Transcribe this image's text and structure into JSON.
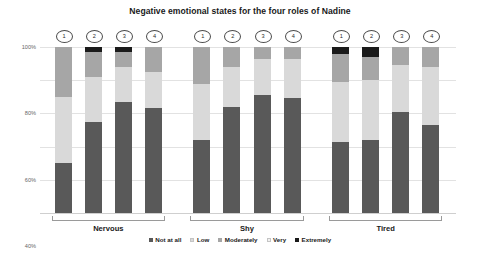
{
  "chart_data": {
    "type": "bar",
    "subtype": "stacked-100-percent",
    "title": "Negative emotional states for the four roles of Nadine",
    "xlabel": "",
    "ylabel": "",
    "ylim": [
      0,
      100
    ],
    "ytick_labels": [
      "0%",
      "20%",
      "40%",
      "60%",
      "80%",
      "100%"
    ],
    "ytick_values": [
      0,
      20,
      40,
      60,
      80,
      100
    ],
    "grid": true,
    "legend_position": "bottom",
    "groups": [
      "Nervous",
      "Shy",
      "Tired"
    ],
    "role_labels": [
      "1",
      "2",
      "3",
      "4"
    ],
    "categories": [
      "Nervous 1",
      "Nervous 2",
      "Nervous 3",
      "Nervous 4",
      "Shy 1",
      "Shy 2",
      "Shy 3",
      "Shy 4",
      "Tired 1",
      "Tired 2",
      "Tired 3",
      "Tired 4"
    ],
    "series": [
      {
        "name": "Not at all",
        "color": "#595959",
        "values": [
          30,
          55,
          67,
          63,
          44,
          64,
          71,
          69,
          43,
          44,
          61,
          53
        ]
      },
      {
        "name": "Low",
        "color": "#d9d9d9",
        "values": [
          40,
          27,
          21,
          22,
          34,
          24,
          22,
          24,
          36,
          36,
          28,
          35
        ]
      },
      {
        "name": "Moderately",
        "color": "#a6a6a6",
        "values": [
          30,
          15,
          9,
          15,
          22,
          12,
          7,
          7,
          17,
          14,
          11,
          12
        ]
      },
      {
        "name": "Very",
        "color": "#f2f2f2",
        "values": [
          0,
          0,
          0,
          0,
          0,
          0,
          0,
          0,
          0,
          0,
          0,
          0
        ]
      },
      {
        "name": "Extremely",
        "color": "#1a1a1a",
        "values": [
          0,
          3,
          3,
          0,
          0,
          0,
          0,
          0,
          4,
          6,
          0,
          0
        ]
      }
    ],
    "legend_entries": [
      {
        "label": "Not at all",
        "color": "#595959"
      },
      {
        "label": "Low",
        "color": "#d9d9d9"
      },
      {
        "label": "Moderately",
        "color": "#a6a6a6"
      },
      {
        "label": "Very",
        "color": "#f2f2f2"
      },
      {
        "label": "Extremely",
        "color": "#1a1a1a"
      }
    ]
  }
}
